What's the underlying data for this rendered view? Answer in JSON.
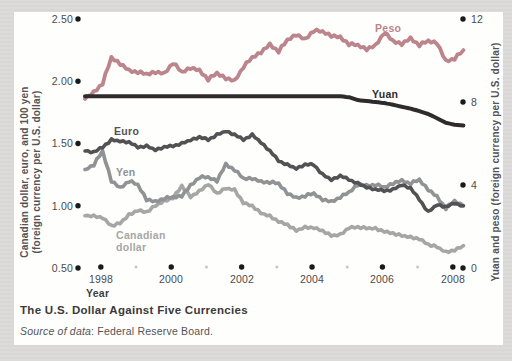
{
  "page": {
    "background_color": "#dbdad8",
    "panel_color": "#fefefd"
  },
  "figure": {
    "title": "The U.S. Dollar Against Five Currencies",
    "source_label": "Source of data",
    "source_value": ": Federal Reserve Board."
  },
  "chart_data": {
    "type": "line",
    "title": "The U.S. Dollar Against Five Currencies",
    "source": "Source of data: Federal Reserve Board.",
    "grid": false,
    "legend_position": "inline-labels-on-lines",
    "tick_style": "bullet-dots",
    "dot_color": "#1a1a1a",
    "minor_dot_color": "#c7c6c4",
    "xaxis": {
      "title": "Year",
      "x_start": 1998.0,
      "x_step": 0.25,
      "x_end": 2008.75,
      "tick_offset": 0.45,
      "major_ticks": [
        {
          "year": 1998,
          "label": "1998"
        },
        {
          "year": 2000,
          "label": "2000"
        },
        {
          "year": 2002,
          "label": "2002"
        },
        {
          "year": 2004,
          "label": "2004"
        },
        {
          "year": 2006,
          "label": "2006"
        },
        {
          "year": 2008,
          "label": "2008"
        }
      ],
      "minor_tick_years": [
        1999,
        2001,
        2003,
        2005,
        2007
      ]
    },
    "yaxis_left": {
      "title": "Canadian dollar, euro, and 100 yen (foreign currency per U.S. dollar)",
      "title_line1": "Canadian dollar, euro, and 100 yen",
      "title_line2": "(foreign currency per U.S. dollar)",
      "range": [
        0.5,
        2.5
      ],
      "ticks": [
        {
          "value": 2.5,
          "label": "2.50"
        },
        {
          "value": 2.0,
          "label": "2.00"
        },
        {
          "value": 1.5,
          "label": "1.50"
        },
        {
          "value": 1.0,
          "label": "1.00"
        },
        {
          "value": 0.5,
          "label": "0.50"
        }
      ]
    },
    "yaxis_right": {
      "title": "Yuan and peso (foreign currency per U.S. dollar)",
      "range": [
        0,
        12
      ],
      "ticks": [
        {
          "value": 12,
          "label": "12"
        },
        {
          "value": 8,
          "label": "8"
        },
        {
          "value": 4,
          "label": "4"
        },
        {
          "value": 0,
          "label": "0"
        }
      ]
    },
    "series": [
      {
        "name": "Peso",
        "axis": "right",
        "color": "#bc858c",
        "values": [
          8.15,
          8.45,
          8.9,
          10.15,
          9.85,
          9.5,
          9.45,
          9.35,
          9.45,
          9.35,
          9.9,
          9.45,
          9.65,
          9.5,
          9.1,
          9.4,
          9.15,
          9.0,
          9.7,
          10.15,
          10.4,
          10.75,
          10.45,
          11.0,
          11.25,
          11.0,
          11.45,
          11.4,
          11.2,
          11.1,
          10.8,
          10.75,
          10.55,
          10.7,
          11.35,
          10.95,
          10.8,
          11.05,
          10.75,
          10.95,
          10.85,
          9.95,
          10.1,
          10.5
        ]
      },
      {
        "name": "Yuan",
        "axis": "right",
        "color": "#2f2b2d",
        "values": [
          8.28,
          8.28,
          8.28,
          8.28,
          8.28,
          8.28,
          8.28,
          8.28,
          8.28,
          8.28,
          8.28,
          8.28,
          8.28,
          8.28,
          8.28,
          8.28,
          8.28,
          8.28,
          8.28,
          8.28,
          8.28,
          8.28,
          8.28,
          8.28,
          8.28,
          8.28,
          8.28,
          8.28,
          8.28,
          8.28,
          8.23,
          8.09,
          8.05,
          8.0,
          7.95,
          7.87,
          7.77,
          7.68,
          7.56,
          7.42,
          7.22,
          7.0,
          6.9,
          6.87
        ]
      },
      {
        "name": "Euro",
        "axis": "left",
        "color": "#525254",
        "values": [
          1.44,
          1.43,
          1.47,
          1.53,
          1.52,
          1.51,
          1.47,
          1.48,
          1.45,
          1.47,
          1.48,
          1.5,
          1.53,
          1.55,
          1.53,
          1.57,
          1.6,
          1.57,
          1.53,
          1.57,
          1.51,
          1.44,
          1.36,
          1.33,
          1.3,
          1.33,
          1.33,
          1.25,
          1.21,
          1.24,
          1.21,
          1.18,
          1.15,
          1.13,
          1.12,
          1.13,
          1.17,
          1.14,
          1.05,
          0.95,
          1.01,
          0.99,
          1.02,
          1.0
        ]
      },
      {
        "name": "Yen",
        "axis": "left",
        "color": "#909294",
        "values": [
          1.29,
          1.33,
          1.44,
          1.2,
          1.14,
          1.2,
          1.17,
          1.05,
          1.03,
          1.06,
          1.07,
          1.08,
          1.16,
          1.23,
          1.23,
          1.2,
          1.33,
          1.29,
          1.22,
          1.22,
          1.19,
          1.19,
          1.18,
          1.1,
          1.06,
          1.08,
          1.1,
          1.05,
          1.03,
          1.07,
          1.11,
          1.17,
          1.16,
          1.17,
          1.15,
          1.18,
          1.2,
          1.18,
          1.21,
          1.13,
          1.07,
          0.98,
          1.04,
          1.0
        ]
      },
      {
        "name": "Canadian dollar",
        "axis": "left",
        "color": "#a7a6a6",
        "values": [
          0.92,
          0.92,
          0.9,
          0.84,
          0.86,
          0.93,
          0.96,
          0.95,
          1.0,
          1.04,
          1.06,
          1.16,
          1.07,
          1.12,
          1.17,
          1.1,
          1.14,
          1.13,
          1.02,
          1.0,
          0.94,
          0.92,
          0.87,
          0.85,
          0.8,
          0.83,
          0.82,
          0.8,
          0.76,
          0.77,
          0.82,
          0.83,
          0.82,
          0.82,
          0.79,
          0.78,
          0.76,
          0.75,
          0.73,
          0.69,
          0.67,
          0.63,
          0.64,
          0.68
        ]
      }
    ]
  }
}
